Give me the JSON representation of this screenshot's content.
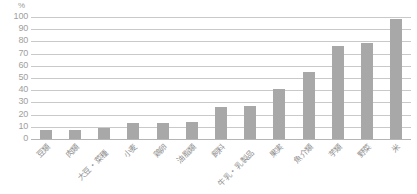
{
  "chart_data": {
    "type": "bar",
    "title": "",
    "subtitle": "",
    "xlabel": "",
    "ylabel": "",
    "unit_label": "%",
    "ylim": [
      0,
      100
    ],
    "ytick_step": 10,
    "yticks": [
      "100",
      "90",
      "80",
      "70",
      "60",
      "50",
      "40",
      "30",
      "20",
      "10",
      "0"
    ],
    "grid": true,
    "legend": false,
    "bar_color": "#a8a8a8",
    "gridline_color": "#c9c9c9",
    "axis_text_color": "#9a9a9a",
    "categories": [
      "豆類",
      "肉類",
      "大豆・菜種",
      "小麦",
      "鶏卵",
      "油脂類",
      "飼料",
      "牛乳・乳製品",
      "果実",
      "魚介類",
      "芋類",
      "野菜",
      "米"
    ],
    "values": [
      7,
      7,
      9,
      13,
      13,
      14,
      26,
      27,
      41,
      55,
      76,
      79,
      98
    ],
    "series": [
      {
        "name": "",
        "values": [
          7,
          7,
          9,
          13,
          13,
          14,
          26,
          27,
          41,
          55,
          76,
          79,
          98
        ]
      }
    ]
  }
}
